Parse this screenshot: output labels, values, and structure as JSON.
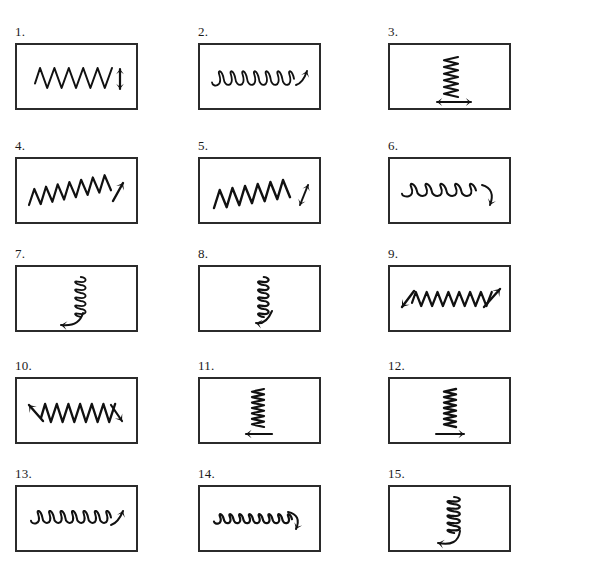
{
  "sheet": {
    "title": "Hand-drawn wave and arrow figure panels worksheet",
    "background_color": "#ffffff",
    "ink_color": "#111111",
    "border_color": "#2b2b2b",
    "columns": 3,
    "rows": 5,
    "panel_count": 15,
    "box_width": 123,
    "box_height": 67,
    "column_x": [
      15,
      198,
      388
    ],
    "row_y": [
      43,
      157,
      265,
      377,
      485
    ],
    "label_offset_y": -18
  },
  "panels": [
    {
      "number": "1.",
      "wave": "zigzag-horizontal",
      "wave_orientation": "horizontal",
      "wave_cycles": 5,
      "arrow": "double-headed-vertical",
      "arrow_position": "right",
      "arrow_direction": "up-down"
    },
    {
      "number": "2.",
      "wave": "loops-horizontal",
      "wave_orientation": "horizontal",
      "wave_cycles": 7,
      "arrow": "single-headed-diagonal",
      "arrow_position": "right",
      "arrow_direction": "up-right"
    },
    {
      "number": "3.",
      "wave": "zigzag-vertical",
      "wave_orientation": "vertical",
      "wave_cycles": 6,
      "arrow": "double-headed-horizontal",
      "arrow_position": "bottom",
      "arrow_direction": "left-right"
    },
    {
      "number": "4.",
      "wave": "sawtooth-horizontal-tilted",
      "wave_orientation": "horizontal",
      "wave_cycles": 7,
      "arrow": "single-headed-diagonal",
      "arrow_position": "right",
      "arrow_direction": "up-right"
    },
    {
      "number": "5.",
      "wave": "sawtooth-horizontal-tilted",
      "wave_orientation": "horizontal",
      "wave_cycles": 6,
      "arrow": "double-headed-diagonal",
      "arrow_position": "right",
      "arrow_direction": "up-right-down-left"
    },
    {
      "number": "6.",
      "wave": "loops-horizontal",
      "wave_orientation": "horizontal",
      "wave_cycles": 5,
      "arrow": "curved-hook",
      "arrow_position": "right",
      "arrow_direction": "curving-down"
    },
    {
      "number": "7.",
      "wave": "loops-vertical",
      "wave_orientation": "vertical",
      "wave_cycles": 5,
      "arrow": "curved-hook",
      "arrow_position": "bottom",
      "arrow_direction": "curving-down-left"
    },
    {
      "number": "8.",
      "wave": "loops-vertical",
      "wave_orientation": "vertical",
      "wave_cycles": 5,
      "arrow": "curved-hook",
      "arrow_position": "bottom",
      "arrow_direction": "curving-down-left"
    },
    {
      "number": "9.",
      "wave": "zigzag-horizontal",
      "wave_orientation": "horizontal",
      "wave_cycles": 7,
      "arrow": "double-headed-diagonal-ends",
      "arrow_position": "both-ends",
      "arrow_direction": "down-left-and-up-right"
    },
    {
      "number": "10.",
      "wave": "zigzag-horizontal",
      "wave_orientation": "horizontal",
      "wave_cycles": 6,
      "arrow": "double-headed-diagonal-ends",
      "arrow_position": "both-ends",
      "arrow_direction": "up-left-and-down-right"
    },
    {
      "number": "11.",
      "wave": "zigzag-vertical",
      "wave_orientation": "vertical",
      "wave_cycles": 7,
      "arrow": "single-headed-horizontal",
      "arrow_position": "bottom",
      "arrow_direction": "left"
    },
    {
      "number": "12.",
      "wave": "zigzag-vertical",
      "wave_orientation": "vertical",
      "wave_cycles": 7,
      "arrow": "single-headed-horizontal",
      "arrow_position": "bottom",
      "arrow_direction": "right"
    },
    {
      "number": "13.",
      "wave": "loops-horizontal",
      "wave_orientation": "horizontal",
      "wave_cycles": 7,
      "arrow": "single-headed-diagonal",
      "arrow_position": "right",
      "arrow_direction": "up-right"
    },
    {
      "number": "14.",
      "wave": "loops-horizontal-small",
      "wave_orientation": "horizontal",
      "wave_cycles": 8,
      "arrow": "curved-hook",
      "arrow_position": "right",
      "arrow_direction": "curving-down"
    },
    {
      "number": "15.",
      "wave": "loops-vertical",
      "wave_orientation": "vertical",
      "wave_cycles": 5,
      "arrow": "curved-hook",
      "arrow_position": "bottom",
      "arrow_direction": "curving-left"
    }
  ]
}
